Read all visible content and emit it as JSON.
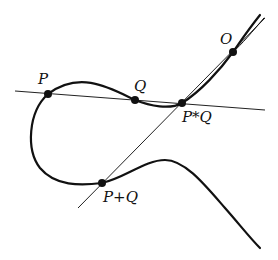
{
  "diagram": {
    "title": "",
    "colors": {
      "background": "#ffffff",
      "curve": "#111111",
      "line": "#222222",
      "point": "#111111"
    },
    "points": [
      {
        "id": "P",
        "label": "P",
        "x": 48,
        "y": 94
      },
      {
        "id": "Q",
        "label": "Q",
        "x": 135,
        "y": 100
      },
      {
        "id": "PstarQ",
        "label": "P*Q",
        "x": 182,
        "y": 103
      },
      {
        "id": "O",
        "label": "O",
        "x": 233,
        "y": 52
      },
      {
        "id": "PplusQ",
        "label": "P+Q",
        "x": 102,
        "y": 183
      }
    ],
    "lines": [
      {
        "id": "chord-PQ",
        "from": [
          15,
          91
        ],
        "to": [
          265,
          110
        ]
      },
      {
        "id": "line-PstarQ-O",
        "from": [
          78,
          208
        ],
        "to": [
          265,
          18
        ]
      }
    ],
    "labels": {
      "P": "P",
      "Q": "Q",
      "PstarQ": "P*Q",
      "O": "O",
      "PplusQ": "P+Q"
    }
  }
}
